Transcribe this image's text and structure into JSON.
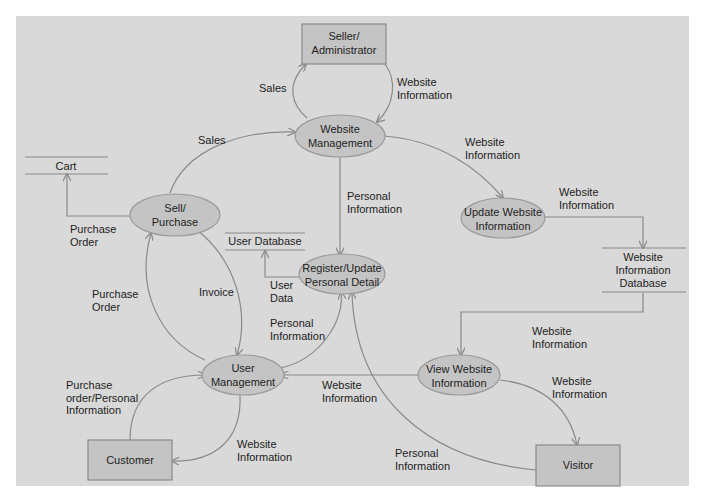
{
  "diagram": {
    "type": "data-flow-diagram",
    "colors": {
      "background": "#d9d9d9",
      "node_fill": "#c4c4c4",
      "line": "#8a8a8a",
      "text": "#222222"
    },
    "external_entities": {
      "seller": [
        "Seller/",
        "Administrator"
      ],
      "customer": [
        "Customer"
      ],
      "visitor": [
        "Visitor"
      ]
    },
    "processes": {
      "website_management": [
        "Website",
        "Management"
      ],
      "sell_purchase": [
        "Sell/",
        "Purchase"
      ],
      "update_website_info": [
        "Update Website",
        "Information"
      ],
      "register_update": [
        "Register/Update",
        "Personal Detail"
      ],
      "user_management": [
        "User",
        "Management"
      ],
      "view_website_info": [
        "View Website",
        "Information"
      ]
    },
    "data_stores": {
      "cart": [
        "Cart"
      ],
      "user_database": [
        "User Database"
      ],
      "website_info_db": [
        "Website",
        "Information",
        "Database"
      ]
    },
    "flows": {
      "sales_to_seller": [
        "Sales"
      ],
      "webinfo_seller_to_mgmt": [
        "Website",
        "Information"
      ],
      "sales_sell_to_mgmt": [
        "Sales"
      ],
      "webinfo_mgmt_to_update": [
        "Website",
        "Information"
      ],
      "personal_mgmt_to_register": [
        "Personal",
        "Information"
      ],
      "webinfo_update_to_db": [
        "Website",
        "Information"
      ],
      "purchase_order_to_cart": [
        "Purchase",
        "Order"
      ],
      "user_data_to_userdb": [
        "User",
        "Data"
      ],
      "purchase_order_user_to_sell": [
        "Purchase",
        "Order"
      ],
      "invoice": [
        "Invoice"
      ],
      "personal_user_to_register": [
        "Personal",
        "Information"
      ],
      "webinfo_db_to_view": [
        "Website",
        "Information"
      ],
      "webinfo_view_to_user": [
        "Website",
        "Information"
      ],
      "webinfo_view_to_visitor": [
        "Website",
        "Information"
      ],
      "purchase_personal_customer": [
        "Purchase",
        "order/Personal",
        "Information"
      ],
      "webinfo_user_to_customer": [
        "Website",
        "Information"
      ],
      "personal_visitor_to_register": [
        "Personal",
        "Information"
      ]
    }
  }
}
